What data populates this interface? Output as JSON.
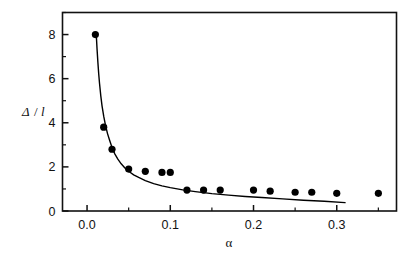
{
  "figure": {
    "background_color": "#ffffff",
    "foreground_color": "#111111",
    "marker_color": "#000000",
    "curve_color": "#000000"
  },
  "axes": {
    "x": {
      "label": "α",
      "tick_labels": [
        "0.0",
        "0.1",
        "0.2",
        "0.3"
      ],
      "tick_values": [
        0.0,
        0.1,
        0.2,
        0.3
      ],
      "minor_tick_values": [
        0.05,
        0.15,
        0.25,
        0.35
      ],
      "range": [
        -0.0295,
        0.3718
      ]
    },
    "y": {
      "label_numerator": "Δ",
      "label_separator": "/",
      "label_denominator": "l",
      "label": "Δ/l",
      "tick_labels": [
        "0",
        "2",
        "4",
        "6",
        "8"
      ],
      "tick_values": [
        0,
        2,
        4,
        6,
        8
      ],
      "minor_tick_values": [
        1,
        3,
        5,
        7,
        9
      ],
      "range": [
        0,
        9.0
      ]
    }
  },
  "chart_data": {
    "type": "scatter",
    "title": "",
    "subtitle": "",
    "xlabel": "α",
    "ylabel": "Δ/l",
    "xlim": [
      -0.0295,
      0.3718
    ],
    "ylim": [
      0,
      9.0
    ],
    "grid": false,
    "legend": null,
    "legend_position": "none",
    "annotations": [],
    "series": [
      {
        "name": "measured",
        "type": "scatter",
        "marker": "filled-circle",
        "marker_size": 6,
        "color": "#000000",
        "x": [
          0.01,
          0.02,
          0.03,
          0.05,
          0.07,
          0.09,
          0.1,
          0.12,
          0.14,
          0.16,
          0.2,
          0.22,
          0.25,
          0.27,
          0.3,
          0.35
        ],
        "y": [
          8.0,
          3.8,
          2.8,
          1.9,
          1.8,
          1.75,
          1.75,
          0.95,
          0.95,
          0.95,
          0.95,
          0.9,
          0.85,
          0.85,
          0.8,
          0.8
        ]
      },
      {
        "name": "fitted-curve",
        "type": "line",
        "color": "#000000",
        "line_width": 1.4,
        "x": [
          0.011,
          0.012,
          0.013,
          0.014,
          0.015,
          0.0165,
          0.018,
          0.02,
          0.022,
          0.0245,
          0.027,
          0.03,
          0.0335,
          0.037,
          0.041,
          0.0455,
          0.05,
          0.056,
          0.062,
          0.07,
          0.08,
          0.09,
          0.1,
          0.115,
          0.13,
          0.15,
          0.17,
          0.19,
          0.21,
          0.235,
          0.26,
          0.285,
          0.31
        ],
        "y": [
          8.05,
          7.35,
          6.75,
          6.22,
          5.78,
          5.22,
          4.77,
          4.3,
          3.92,
          3.52,
          3.22,
          2.88,
          2.58,
          2.35,
          2.14,
          1.95,
          1.8,
          1.64,
          1.52,
          1.38,
          1.24,
          1.14,
          1.06,
          0.96,
          0.88,
          0.79,
          0.72,
          0.66,
          0.61,
          0.55,
          0.49,
          0.44,
          0.38
        ]
      }
    ]
  }
}
